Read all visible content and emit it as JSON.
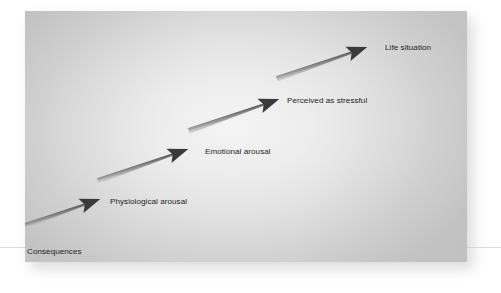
{
  "figure": {
    "background_color": "#ffffff",
    "panel_color_center": "#f4f4f4",
    "panel_color_edge": "#c6c6c6",
    "arrow_color_dark": "#3a3a3a",
    "arrow_color_light": "#d9d9d9",
    "text_color": "#1d1d1d"
  },
  "diagram": {
    "type": "flow",
    "direction": "top-right to bottom-left",
    "steps": [
      {
        "id": "life-situation",
        "label": "Life situation"
      },
      {
        "id": "perceived-stressful",
        "label": "Perceived as stressful"
      },
      {
        "id": "emotional-arousal",
        "label": "Emotional arousal"
      },
      {
        "id": "physiological-arousal",
        "label": "Physiological arousal"
      },
      {
        "id": "consequences",
        "label": "Consequences"
      }
    ],
    "connectors": [
      {
        "id": "arrow-1",
        "from": "life-situation",
        "to": "perceived-stressful"
      },
      {
        "id": "arrow-2",
        "from": "perceived-stressful",
        "to": "emotional-arousal"
      },
      {
        "id": "arrow-3",
        "from": "emotional-arousal",
        "to": "physiological-arousal"
      },
      {
        "id": "arrow-4",
        "from": "physiological-arousal",
        "to": "consequences"
      }
    ]
  }
}
